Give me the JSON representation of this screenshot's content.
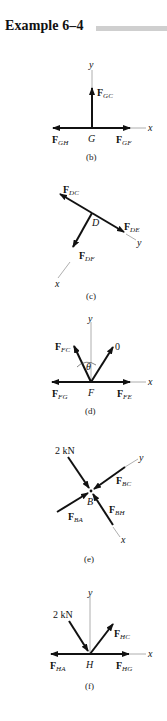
{
  "header": {
    "title": "Example 6–4"
  },
  "figures": [
    {
      "id": "b",
      "caption": "(b)",
      "joint": "G",
      "axes": [
        "x",
        "y"
      ],
      "forces": [
        {
          "name": "F",
          "sub": "GC"
        },
        {
          "name": "F",
          "sub": "GH"
        },
        {
          "name": "F",
          "sub": "GF"
        }
      ]
    },
    {
      "id": "c",
      "caption": "(c)",
      "joint": "D",
      "axes": [
        "x",
        "y"
      ],
      "forces": [
        {
          "name": "F",
          "sub": "DC"
        },
        {
          "name": "F",
          "sub": "DE"
        },
        {
          "name": "F",
          "sub": "DF"
        }
      ]
    },
    {
      "id": "d",
      "caption": "(d)",
      "joint": "F",
      "axes": [
        "x",
        "y"
      ],
      "angle": "θ",
      "zero_label": "0",
      "forces": [
        {
          "name": "F",
          "sub": "FC"
        },
        {
          "name": "F",
          "sub": "FG"
        },
        {
          "name": "F",
          "sub": "FE"
        }
      ]
    },
    {
      "id": "e",
      "caption": "(e)",
      "joint": "B",
      "axes": [
        "x",
        "y"
      ],
      "load": "2 kN",
      "forces": [
        {
          "name": "F",
          "sub": "BC"
        },
        {
          "name": "F",
          "sub": "BA"
        },
        {
          "name": "F",
          "sub": "BH"
        }
      ]
    },
    {
      "id": "f",
      "caption": "(f)",
      "joint": "H",
      "axes": [
        "x",
        "y"
      ],
      "load": "2 kN",
      "forces": [
        {
          "name": "F",
          "sub": "HC"
        },
        {
          "name": "F",
          "sub": "HA"
        },
        {
          "name": "F",
          "sub": "HG"
        }
      ]
    }
  ],
  "colors": {
    "ink": "#111111",
    "axis": "#9a9a9a",
    "title_bar": "#cfcfcf"
  }
}
